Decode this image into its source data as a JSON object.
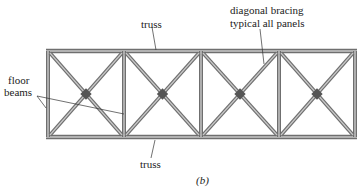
{
  "diagram": {
    "type": "truss-plan-view",
    "caption": "(b)",
    "labels": {
      "top_truss": "truss",
      "bottom_truss": "truss",
      "diagonal_bracing_line1": "diagonal bracing",
      "diagonal_bracing_line2": "typical all panels",
      "floor_beams_line1": "floor",
      "floor_beams_line2": "beams"
    },
    "panels": 4,
    "colors": {
      "member_edge": "#6f6f6f",
      "member_fill": "#c9c9c9",
      "text": "#222222",
      "background": "#ffffff"
    }
  }
}
